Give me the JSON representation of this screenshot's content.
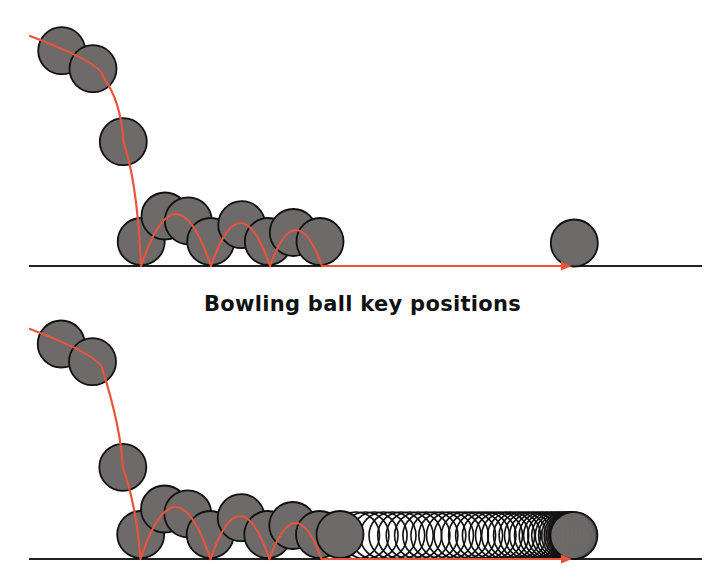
{
  "figure": {
    "caption": "Bowling ball key positions",
    "colors": {
      "background": "#ffffff",
      "ball_fill": "#6e6a69",
      "ball_stroke": "#111111",
      "path": "#e8553c",
      "ground": "#222222"
    },
    "ball_radius": 23.5,
    "panels": [
      {
        "name": "key-positions",
        "ground_y": 266,
        "ground_x": [
          29,
          702
        ],
        "path_start": [
          30,
          36
        ],
        "arrow_end_x": 572,
        "balls": [
          [
            61.7,
            50.7
          ],
          [
            93,
            68.7
          ],
          [
            123.3,
            141.7
          ],
          [
            141.2,
            241.5
          ],
          [
            165,
            216
          ],
          [
            188.3,
            220.8
          ],
          [
            210.7,
            241.5
          ],
          [
            241.7,
            224.7
          ],
          [
            268.3,
            241.5
          ],
          [
            293.3,
            232.5
          ],
          [
            320,
            241.5
          ],
          [
            574.3,
            243
          ]
        ],
        "bounces": [
          {
            "x1": 141,
            "x2": 211,
            "peak_y": 214
          },
          {
            "x1": 211,
            "x2": 270,
            "peak_y": 223
          },
          {
            "x1": 270,
            "x2": 322,
            "peak_y": 230
          }
        ],
        "rolling_frames": false
      },
      {
        "name": "all-positions",
        "ground_y": 559,
        "ground_x": [
          29,
          702
        ],
        "path_start": [
          30,
          329
        ],
        "arrow_end_x": 572,
        "balls": [
          [
            61.2,
            344
          ],
          [
            92.5,
            361.7
          ],
          [
            122.8,
            467.3
          ],
          [
            140.7,
            534.5
          ],
          [
            164.5,
            509
          ],
          [
            187.8,
            513.8
          ],
          [
            210.2,
            534.5
          ],
          [
            241.2,
            517.7
          ],
          [
            267.8,
            534.5
          ],
          [
            292.8,
            525.5
          ],
          [
            319.5,
            534.5
          ],
          [
            340,
            534.5
          ]
        ],
        "bounces": [
          {
            "x1": 140.5,
            "x2": 210.5,
            "peak_y": 507
          },
          {
            "x1": 210.5,
            "x2": 269.5,
            "peak_y": 516
          },
          {
            "x1": 269.5,
            "x2": 321.5,
            "peak_y": 523
          }
        ],
        "rolling_frames": true,
        "rolling": {
          "start_x": 356,
          "end_x": 574,
          "count": 38,
          "filled_tail": 6
        }
      }
    ]
  }
}
